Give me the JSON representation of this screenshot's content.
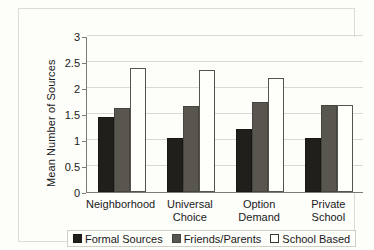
{
  "chart_data": {
    "type": "bar",
    "title": "",
    "xlabel": "",
    "ylabel": "Mean Number of Sources",
    "ylim": [
      0,
      3
    ],
    "ytick_labels": [
      "0",
      "0.5",
      "1",
      "1.5",
      "2",
      "2.5",
      "3"
    ],
    "ytick_values": [
      0,
      0.5,
      1,
      1.5,
      2,
      2.5,
      3
    ],
    "grid": true,
    "legend_position": "bottom",
    "categories": [
      "Neighborhood",
      "Universal Choice",
      "Option Demand",
      "Private School"
    ],
    "category_lines": [
      [
        "Neighborhood"
      ],
      [
        "Universal",
        "Choice"
      ],
      [
        "Option",
        "Demand"
      ],
      [
        "Private School"
      ]
    ],
    "series": [
      {
        "name": "Formal Sources",
        "color": "#211f1c",
        "values": [
          1.45,
          1.04,
          1.22,
          1.04
        ]
      },
      {
        "name": "Friends/Parents",
        "color": "#58564f",
        "values": [
          1.62,
          1.66,
          1.74,
          1.67
        ]
      },
      {
        "name": "School Based",
        "color": "#fefefb",
        "values": [
          2.39,
          2.35,
          2.2,
          1.67
        ]
      }
    ]
  },
  "axis": {
    "y_title": "Mean Number of Sources"
  },
  "legend": {
    "items": [
      {
        "label": "Formal Sources",
        "swatch": "formal"
      },
      {
        "label": "Friends/Parents",
        "swatch": "friends"
      },
      {
        "label": "School Based",
        "swatch": "school"
      }
    ]
  }
}
